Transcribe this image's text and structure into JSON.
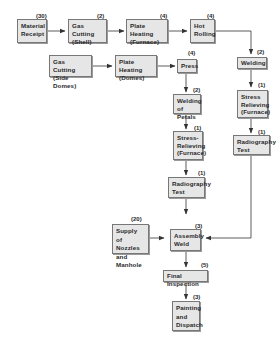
{
  "diagram": {
    "type": "process-flowchart",
    "nodes": [
      {
        "id": "material-receipt",
        "label": "Material\nReceipt",
        "duration": "(30)"
      },
      {
        "id": "gas-cutting-shell",
        "label": "Gas Cutting\n(Shell)",
        "duration": "(2)"
      },
      {
        "id": "plate-heating-furnace",
        "label": "Plate Heating\n(Furnace)",
        "duration": "(4)"
      },
      {
        "id": "hot-rolling",
        "label": "Hot\nRolling",
        "duration": "(4)"
      },
      {
        "id": "welding",
        "label": "Welding",
        "duration": "(2)"
      },
      {
        "id": "stress-relieving-shell",
        "label": "Stress\nRelieving\n(Furnace)",
        "duration": "(1)"
      },
      {
        "id": "radiography-test-shell",
        "label": "Radiography\nTest",
        "duration": "(1)"
      },
      {
        "id": "gas-cutting-side-domes",
        "label": "Gas Cutting\n(Side Domes)",
        "duration": ""
      },
      {
        "id": "plate-heating-domes",
        "label": "Plate Heating\n(Domes)",
        "duration": ""
      },
      {
        "id": "press",
        "label": "Press",
        "duration": "(4)"
      },
      {
        "id": "welding-of-petals",
        "label": "Welding\nof Petals",
        "duration": "(2)"
      },
      {
        "id": "stress-relieving-domes",
        "label": "Stress-\nRelieving\n(Furnace)",
        "duration": "(1)"
      },
      {
        "id": "radiography-test-domes",
        "label": "Radiography\nTest",
        "duration": "(1)"
      },
      {
        "id": "supply-nozzles-manhole",
        "label": "Supply of\nNozzles and\nManhole",
        "duration": "(20)"
      },
      {
        "id": "assembly-weld",
        "label": "Assembly\nWeld",
        "duration": "(3)"
      },
      {
        "id": "final-inspection",
        "label": "Final Inspection",
        "duration": "(5)"
      },
      {
        "id": "painting-dispatch",
        "label": "Painting\nand\nDispatch",
        "duration": "(3)"
      }
    ],
    "edges": [
      [
        "material-receipt",
        "gas-cutting-shell"
      ],
      [
        "gas-cutting-shell",
        "plate-heating-furnace"
      ],
      [
        "plate-heating-furnace",
        "hot-rolling"
      ],
      [
        "hot-rolling",
        "welding"
      ],
      [
        "welding",
        "stress-relieving-shell"
      ],
      [
        "stress-relieving-shell",
        "radiography-test-shell"
      ],
      [
        "radiography-test-shell",
        "assembly-weld"
      ],
      [
        "gas-cutting-side-domes",
        "plate-heating-domes"
      ],
      [
        "plate-heating-domes",
        "press"
      ],
      [
        "press",
        "welding-of-petals"
      ],
      [
        "welding-of-petals",
        "stress-relieving-domes"
      ],
      [
        "stress-relieving-domes",
        "radiography-test-domes"
      ],
      [
        "radiography-test-domes",
        "assembly-weld"
      ],
      [
        "supply-nozzles-manhole",
        "assembly-weld"
      ],
      [
        "assembly-weld",
        "final-inspection"
      ],
      [
        "final-inspection",
        "painting-dispatch"
      ]
    ]
  },
  "colors": {
    "box_fill": "#e6e6e6",
    "box_border": "#777777",
    "line": "#333333",
    "text": "#2a2a2a"
  }
}
